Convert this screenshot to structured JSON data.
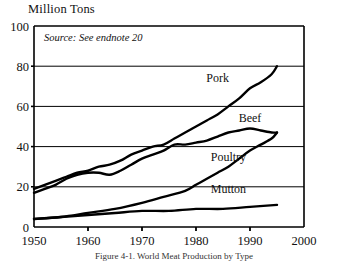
{
  "chart_data": {
    "type": "line",
    "title": "",
    "ylabel": "Million Tons",
    "xlabel": "",
    "annotation": "Source: See endnote 20",
    "caption": "Figure 4-1. World Meat Production by Type",
    "xlim": [
      1950,
      2000
    ],
    "ylim": [
      0,
      100
    ],
    "yticks": [
      0,
      20,
      40,
      60,
      80,
      100
    ],
    "ytick_labels": [
      "0",
      "20",
      "40",
      "60",
      "80",
      "100"
    ],
    "xticks": [
      1950,
      1960,
      1970,
      1980,
      1990,
      2000
    ],
    "xtick_labels": [
      "1950",
      "1960",
      "1970",
      "1980",
      "1990",
      "2000"
    ],
    "grid": "horizontal",
    "legend_position": "inline-labels",
    "series": [
      {
        "name": "Pork",
        "label": "Pork",
        "label_x": 1984,
        "label_y": 72,
        "color": "#000000",
        "x": [
          1950,
          1952,
          1954,
          1956,
          1958,
          1960,
          1962,
          1964,
          1966,
          1968,
          1970,
          1972,
          1974,
          1976,
          1978,
          1980,
          1982,
          1984,
          1986,
          1988,
          1990,
          1992,
          1994,
          1995
        ],
        "values": [
          19,
          21,
          23,
          25,
          27,
          28,
          30,
          31,
          33,
          36,
          38,
          40,
          41,
          44,
          47,
          50,
          53,
          56,
          60,
          64,
          69,
          72,
          76,
          80
        ]
      },
      {
        "name": "Beef",
        "label": "Beef",
        "label_x": 1990,
        "label_y": 52,
        "color": "#000000",
        "x": [
          1950,
          1952,
          1954,
          1956,
          1958,
          1960,
          1962,
          1964,
          1966,
          1968,
          1970,
          1972,
          1974,
          1976,
          1978,
          1980,
          1982,
          1984,
          1986,
          1988,
          1990,
          1992,
          1994,
          1995
        ],
        "values": [
          17,
          19,
          21,
          24,
          26,
          27,
          27,
          26,
          28,
          31,
          34,
          36,
          38,
          41,
          41,
          42,
          43,
          45,
          47,
          48,
          49,
          48,
          47,
          47
        ]
      },
      {
        "name": "Poultry",
        "label": "Poultry",
        "label_x": 1986,
        "label_y": 33,
        "color": "#000000",
        "x": [
          1950,
          1955,
          1960,
          1965,
          1970,
          1974,
          1978,
          1980,
          1982,
          1984,
          1986,
          1988,
          1990,
          1992,
          1994,
          1995
        ],
        "values": [
          4,
          5,
          7,
          9,
          12,
          15,
          18,
          21,
          24,
          27,
          30,
          34,
          38,
          41,
          44,
          47
        ]
      },
      {
        "name": "Mutton",
        "label": "Mutton",
        "label_x": 1986,
        "label_y": 17,
        "color": "#000000",
        "x": [
          1950,
          1955,
          1960,
          1965,
          1970,
          1975,
          1980,
          1985,
          1990,
          1995
        ],
        "values": [
          4,
          5,
          6,
          7,
          8,
          8,
          9,
          9,
          10,
          11
        ]
      }
    ]
  }
}
